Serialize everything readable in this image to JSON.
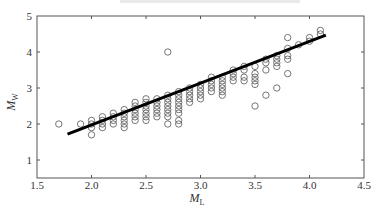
{
  "chart_data": {
    "type": "scatter",
    "title": "",
    "xlabel": "M_L",
    "ylabel": "M_w",
    "xlim": [
      1.5,
      4.5
    ],
    "ylim": [
      0.5,
      5
    ],
    "xticks": [
      1.5,
      2.0,
      2.5,
      3.0,
      3.5,
      4.0,
      4.5
    ],
    "xtick_labels": [
      "1.5",
      "2.0",
      "2.5",
      "3.0",
      "3.5",
      "4.0",
      "4.5"
    ],
    "yticks": [
      1,
      2,
      3,
      4,
      5
    ],
    "ytick_labels": [
      "1",
      "2",
      "3",
      "4",
      "5"
    ],
    "grid": false,
    "legend": null,
    "series": [
      {
        "name": "observations",
        "marker": "open-circle",
        "points": [
          [
            1.7,
            2.0
          ],
          [
            1.9,
            2.0
          ],
          [
            2.0,
            1.7
          ],
          [
            2.0,
            1.9
          ],
          [
            2.0,
            2.0
          ],
          [
            2.0,
            2.1
          ],
          [
            2.1,
            1.9
          ],
          [
            2.1,
            2.0
          ],
          [
            2.1,
            2.1
          ],
          [
            2.1,
            2.2
          ],
          [
            2.2,
            2.0
          ],
          [
            2.2,
            2.1
          ],
          [
            2.2,
            2.2
          ],
          [
            2.2,
            2.3
          ],
          [
            2.3,
            1.9
          ],
          [
            2.3,
            2.0
          ],
          [
            2.3,
            2.1
          ],
          [
            2.3,
            2.2
          ],
          [
            2.3,
            2.3
          ],
          [
            2.3,
            2.4
          ],
          [
            2.4,
            2.1
          ],
          [
            2.4,
            2.2
          ],
          [
            2.4,
            2.3
          ],
          [
            2.4,
            2.4
          ],
          [
            2.4,
            2.5
          ],
          [
            2.4,
            2.6
          ],
          [
            2.5,
            2.1
          ],
          [
            2.5,
            2.2
          ],
          [
            2.5,
            2.3
          ],
          [
            2.5,
            2.4
          ],
          [
            2.5,
            2.5
          ],
          [
            2.5,
            2.6
          ],
          [
            2.5,
            2.7
          ],
          [
            2.6,
            2.2
          ],
          [
            2.6,
            2.3
          ],
          [
            2.6,
            2.4
          ],
          [
            2.6,
            2.5
          ],
          [
            2.6,
            2.6
          ],
          [
            2.6,
            2.7
          ],
          [
            2.7,
            2.2
          ],
          [
            2.7,
            2.3
          ],
          [
            2.7,
            2.4
          ],
          [
            2.7,
            2.5
          ],
          [
            2.7,
            2.6
          ],
          [
            2.7,
            2.7
          ],
          [
            2.7,
            2.8
          ],
          [
            2.7,
            2.0
          ],
          [
            2.7,
            4.0
          ],
          [
            2.8,
            2.3
          ],
          [
            2.8,
            2.4
          ],
          [
            2.8,
            2.5
          ],
          [
            2.8,
            2.6
          ],
          [
            2.8,
            2.7
          ],
          [
            2.8,
            2.8
          ],
          [
            2.8,
            2.9
          ],
          [
            2.8,
            2.0
          ],
          [
            2.8,
            2.1
          ],
          [
            2.9,
            2.6
          ],
          [
            2.9,
            2.7
          ],
          [
            2.9,
            2.8
          ],
          [
            2.9,
            2.9
          ],
          [
            2.9,
            3.0
          ],
          [
            3.0,
            2.7
          ],
          [
            3.0,
            2.8
          ],
          [
            3.0,
            2.9
          ],
          [
            3.0,
            3.0
          ],
          [
            3.0,
            3.1
          ],
          [
            3.1,
            2.9
          ],
          [
            3.1,
            3.0
          ],
          [
            3.1,
            3.1
          ],
          [
            3.1,
            3.2
          ],
          [
            3.1,
            3.3
          ],
          [
            3.2,
            2.8
          ],
          [
            3.2,
            2.9
          ],
          [
            3.2,
            3.0
          ],
          [
            3.2,
            3.1
          ],
          [
            3.2,
            3.2
          ],
          [
            3.2,
            3.3
          ],
          [
            3.3,
            3.2
          ],
          [
            3.3,
            3.3
          ],
          [
            3.3,
            3.4
          ],
          [
            3.3,
            3.5
          ],
          [
            3.4,
            3.2
          ],
          [
            3.4,
            3.3
          ],
          [
            3.4,
            3.5
          ],
          [
            3.4,
            3.6
          ],
          [
            3.5,
            3.1
          ],
          [
            3.5,
            3.2
          ],
          [
            3.5,
            3.3
          ],
          [
            3.5,
            3.4
          ],
          [
            3.5,
            3.6
          ],
          [
            3.5,
            2.5
          ],
          [
            3.6,
            3.5
          ],
          [
            3.6,
            3.7
          ],
          [
            3.6,
            3.8
          ],
          [
            3.6,
            2.8
          ],
          [
            3.7,
            3.6
          ],
          [
            3.7,
            3.7
          ],
          [
            3.7,
            3.8
          ],
          [
            3.7,
            3.9
          ],
          [
            3.7,
            3.0
          ],
          [
            3.8,
            3.8
          ],
          [
            3.8,
            3.9
          ],
          [
            3.8,
            4.1
          ],
          [
            3.8,
            4.4
          ],
          [
            3.8,
            3.4
          ],
          [
            3.9,
            4.2
          ],
          [
            4.0,
            4.3
          ],
          [
            4.0,
            4.4
          ],
          [
            4.1,
            4.5
          ],
          [
            4.1,
            4.6
          ]
        ]
      },
      {
        "name": "regression line",
        "type": "line",
        "x": [
          1.78,
          4.15
        ],
        "y": [
          1.72,
          4.47
        ],
        "color": "#000000"
      }
    ]
  }
}
